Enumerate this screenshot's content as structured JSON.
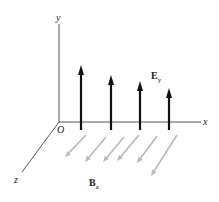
{
  "diagram": {
    "axes": {
      "y_label": "y",
      "x_label": "x",
      "z_label": "z",
      "origin_label": "O",
      "origin": [
        59,
        122
      ],
      "y_end": [
        59,
        24
      ],
      "x_end": [
        201,
        122
      ],
      "z_end": [
        22,
        172
      ],
      "axis_color": "#555555"
    },
    "electric_field": {
      "label_main": "E",
      "label_sub": "y",
      "arrow_color": "#111111",
      "arrows": [
        {
          "x": 81,
          "top": 65,
          "bottom": 130
        },
        {
          "x": 111,
          "top": 75,
          "bottom": 130
        },
        {
          "x": 140,
          "top": 81,
          "bottom": 130
        },
        {
          "x": 169,
          "top": 88,
          "bottom": 130
        }
      ]
    },
    "magnetic_field": {
      "label_main": "B",
      "label_sub": "z",
      "arrow_color": "#b8b8b8",
      "arrows": [
        {
          "x1": 86,
          "y1": 135,
          "x2": 65,
          "y2": 157
        },
        {
          "x1": 106,
          "y1": 137,
          "x2": 85,
          "y2": 162
        },
        {
          "x1": 124,
          "y1": 137,
          "x2": 103,
          "y2": 162
        },
        {
          "x1": 139,
          "y1": 135,
          "x2": 117,
          "y2": 161
        },
        {
          "x1": 157,
          "y1": 136,
          "x2": 137,
          "y2": 163
        },
        {
          "x1": 177,
          "y1": 135,
          "x2": 151,
          "y2": 176
        }
      ]
    }
  }
}
